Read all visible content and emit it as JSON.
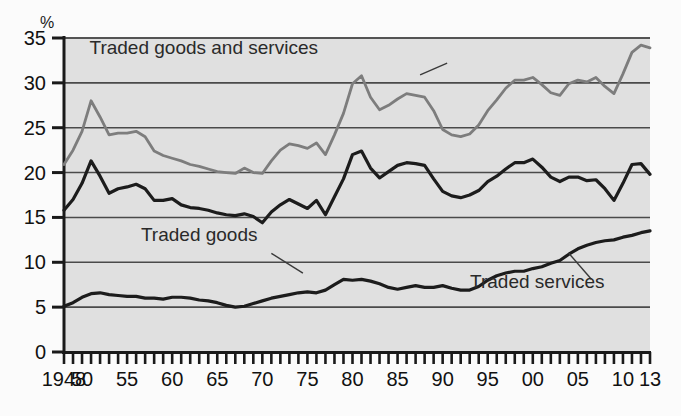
{
  "chart_data": {
    "type": "line",
    "title": "",
    "subtitle": "",
    "unit_label": "%",
    "xlabel": "",
    "ylabel": "",
    "xlim": [
      1948,
      2013
    ],
    "ylim": [
      0,
      35
    ],
    "y_ticks": [
      "0",
      "5",
      "10",
      "15",
      "20",
      "25",
      "30",
      "35"
    ],
    "y_tick_values": [
      0,
      5,
      10,
      15,
      20,
      25,
      30,
      35
    ],
    "x_tick_labels": [
      "1948",
      "50",
      "55",
      "60",
      "65",
      "70",
      "75",
      "80",
      "85",
      "90",
      "95",
      "00",
      "05",
      "10",
      "13"
    ],
    "x_tick_values": [
      1948,
      1950,
      1955,
      1960,
      1965,
      1970,
      1975,
      1980,
      1985,
      1990,
      1995,
      2000,
      2005,
      2010,
      2013
    ],
    "x_minor_tick_step": 1,
    "grid": "horizontal",
    "legend_position": "inline-annotations",
    "plot_background": "#e0e0e0",
    "colors": {
      "traded_goods_and_services": "#7d7d7d",
      "traded_goods": "#1c1c1c",
      "traded_services": "#1c1c1c",
      "grid": "#4a4a4a",
      "axis": "#1a1a1a"
    },
    "annotations": [
      {
        "text": "Traded goods and services",
        "x": 1963.5,
        "y": 33.2,
        "leader_from": [
          1987.5,
          30.9
        ],
        "leader_to": [
          1990.5,
          32.2
        ]
      },
      {
        "text": "Traded goods",
        "x": 1963.0,
        "y": 12.4,
        "leader_from": [
          1974.5,
          8.8
        ],
        "leader_to": [
          1971.0,
          11.0
        ]
      },
      {
        "text": "Traded services",
        "x": 2000.5,
        "y": 7.1,
        "leader_from": [
          2004.0,
          11.0
        ],
        "leader_to": [
          2006.5,
          8.1
        ]
      }
    ],
    "x": [
      1948,
      1949,
      1950,
      1951,
      1952,
      1953,
      1954,
      1955,
      1956,
      1957,
      1958,
      1959,
      1960,
      1961,
      1962,
      1963,
      1964,
      1965,
      1966,
      1967,
      1968,
      1969,
      1970,
      1971,
      1972,
      1973,
      1974,
      1975,
      1976,
      1977,
      1978,
      1979,
      1980,
      1981,
      1982,
      1983,
      1984,
      1985,
      1986,
      1987,
      1988,
      1989,
      1990,
      1991,
      1992,
      1993,
      1994,
      1995,
      1996,
      1997,
      1998,
      1999,
      2000,
      2001,
      2002,
      2003,
      2004,
      2005,
      2006,
      2007,
      2008,
      2009,
      2010,
      2011,
      2012,
      2013
    ],
    "series": [
      {
        "name": "Traded goods and services",
        "color": "#7d7d7d",
        "values": [
          20.9,
          22.5,
          24.6,
          28.0,
          26.2,
          24.2,
          24.4,
          24.4,
          24.6,
          24.0,
          22.4,
          21.9,
          21.6,
          21.3,
          20.9,
          20.7,
          20.4,
          20.1,
          20.0,
          19.9,
          20.5,
          20.0,
          19.9,
          21.3,
          22.5,
          23.2,
          23.0,
          22.7,
          23.3,
          22.0,
          24.2,
          26.6,
          29.9,
          30.8,
          28.4,
          27.0,
          27.5,
          28.2,
          28.8,
          28.6,
          28.4,
          26.9,
          24.8,
          24.2,
          24.0,
          24.3,
          25.3,
          26.9,
          28.1,
          29.4,
          30.3,
          30.3,
          30.6,
          29.8,
          28.9,
          28.6,
          29.9,
          30.3,
          30.1,
          30.6,
          29.6,
          28.8,
          31.0,
          33.4,
          34.2,
          33.9
        ]
      },
      {
        "name": "Traded goods",
        "color": "#1c1c1c",
        "values": [
          15.8,
          17.0,
          18.8,
          21.3,
          19.6,
          17.7,
          18.2,
          18.4,
          18.7,
          18.2,
          16.9,
          16.9,
          17.1,
          16.4,
          16.1,
          16.0,
          15.8,
          15.5,
          15.3,
          15.2,
          15.4,
          15.1,
          14.4,
          15.6,
          16.4,
          17.0,
          16.5,
          16.0,
          16.9,
          15.3,
          17.3,
          19.3,
          22.0,
          22.4,
          20.5,
          19.4,
          20.1,
          20.8,
          21.1,
          21.0,
          20.8,
          19.3,
          17.9,
          17.4,
          17.2,
          17.5,
          18.0,
          19.0,
          19.6,
          20.4,
          21.1,
          21.1,
          21.5,
          20.6,
          19.5,
          19.0,
          19.5,
          19.5,
          19.1,
          19.2,
          18.2,
          16.9,
          18.8,
          20.9,
          21.0,
          19.8
        ]
      },
      {
        "name": "Traded services",
        "color": "#1c1c1c",
        "values": [
          5.1,
          5.5,
          6.1,
          6.5,
          6.6,
          6.4,
          6.3,
          6.2,
          6.2,
          6.0,
          6.0,
          5.9,
          6.1,
          6.1,
          6.0,
          5.8,
          5.7,
          5.5,
          5.2,
          5.0,
          5.1,
          5.4,
          5.7,
          6.0,
          6.2,
          6.4,
          6.6,
          6.7,
          6.6,
          6.9,
          7.5,
          8.1,
          8.0,
          8.1,
          7.9,
          7.6,
          7.2,
          7.0,
          7.2,
          7.4,
          7.2,
          7.2,
          7.4,
          7.1,
          6.9,
          6.9,
          7.3,
          8.0,
          8.5,
          8.8,
          9.0,
          9.0,
          9.3,
          9.5,
          9.9,
          10.2,
          10.9,
          11.5,
          11.9,
          12.2,
          12.4,
          12.5,
          12.8,
          13.0,
          13.3,
          13.5
        ]
      }
    ]
  }
}
